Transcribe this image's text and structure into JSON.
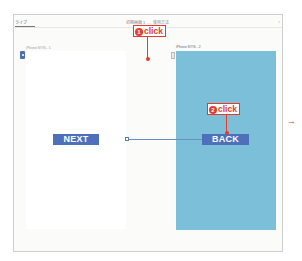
{
  "header": {
    "tab_label": "ライブ",
    "scene_title": "初期画面 1",
    "scene_subtitle": "使用方法",
    "scene_separator": "—",
    "zoom_label": "▫"
  },
  "canvas": {
    "screens": [
      {
        "label": "iPhone 8/7/6 - 1",
        "background": "#ffffff",
        "button": {
          "label": "NEXT",
          "color": "#4e70bb"
        }
      },
      {
        "label": "iPhone 8/7/6 - 2",
        "background": "#7bbfd8",
        "button": {
          "label": "BACK",
          "color": "#4e70bb"
        }
      }
    ],
    "segue": {
      "from": "NEXT",
      "to": "iPhone 8/7/6 - 2"
    }
  },
  "annotations": {
    "callout_1": {
      "number": "1",
      "text": "click"
    },
    "callout_2": {
      "number": "2",
      "text": "click"
    },
    "accent_color": "#e33b2e",
    "next_arrow": "→"
  }
}
